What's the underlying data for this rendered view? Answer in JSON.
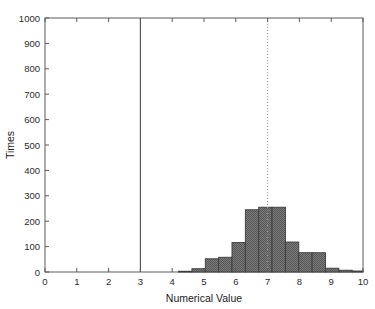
{
  "chart_data": {
    "type": "bar",
    "title": "",
    "subtitle": "",
    "xlabel": "Numerical Value",
    "ylabel": "Times",
    "xlim": [
      0,
      10
    ],
    "ylim": [
      0,
      1000
    ],
    "grid": false,
    "legend": null,
    "xticks": [
      "0",
      "1",
      "2",
      "3",
      "4",
      "5",
      "6",
      "7",
      "8",
      "9",
      "10"
    ],
    "xtick_values": [
      0,
      1,
      2,
      3,
      4,
      5,
      6,
      7,
      8,
      9,
      10
    ],
    "yticks": [
      "0",
      "100",
      "200",
      "300",
      "400",
      "500",
      "600",
      "700",
      "800",
      "900",
      "1000"
    ],
    "ytick_values": [
      0,
      100,
      200,
      300,
      400,
      500,
      600,
      700,
      800,
      900,
      1000
    ],
    "bin_width": 0.42,
    "bars": [
      {
        "x0": 4.2,
        "x1": 4.62,
        "value": 3
      },
      {
        "x0": 4.62,
        "x1": 5.04,
        "value": 13
      },
      {
        "x0": 5.04,
        "x1": 5.46,
        "value": 52
      },
      {
        "x0": 5.46,
        "x1": 5.88,
        "value": 58
      },
      {
        "x0": 5.88,
        "x1": 6.3,
        "value": 116
      },
      {
        "x0": 6.3,
        "x1": 6.72,
        "value": 245
      },
      {
        "x0": 6.72,
        "x1": 7.14,
        "value": 255
      },
      {
        "x0": 7.14,
        "x1": 7.56,
        "value": 255
      },
      {
        "x0": 7.56,
        "x1": 7.98,
        "value": 118
      },
      {
        "x0": 7.98,
        "x1": 8.4,
        "value": 76
      },
      {
        "x0": 8.4,
        "x1": 8.82,
        "value": 76
      },
      {
        "x0": 8.82,
        "x1": 9.24,
        "value": 15
      },
      {
        "x0": 9.24,
        "x1": 9.66,
        "value": 7
      },
      {
        "x0": 9.66,
        "x1": 10.0,
        "value": 4
      }
    ],
    "bar_fill": "#6e6e6e",
    "bar_edge": "#3d3d3d",
    "reference_lines": [
      {
        "name": "solid-reference-line",
        "x": 3,
        "style": "solid",
        "color": "#4a4a4a"
      },
      {
        "name": "dotted-reference-line",
        "x": 7,
        "style": "dotted",
        "color": "#9a9a9a"
      }
    ],
    "axis_color": "#5a5a5a"
  }
}
